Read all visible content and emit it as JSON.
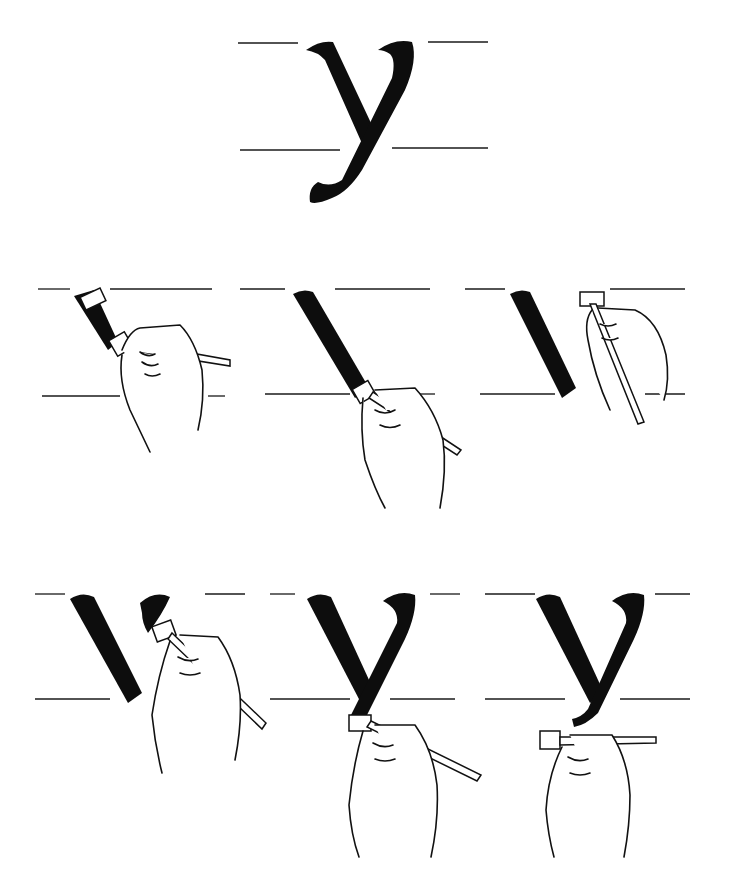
{
  "figure": {
    "letter": "y",
    "colors": {
      "ink": "#0d0d0d",
      "background": "#ffffff",
      "guide_lines": "#1a1a1a"
    },
    "main_glyph": {
      "label": "completed letter y"
    },
    "steps": [
      {
        "index": 1,
        "label": "pen placed at top of first diagonal stroke"
      },
      {
        "index": 2,
        "label": "first diagonal stroke pulled down to baseline"
      },
      {
        "index": 3,
        "label": "pen repositioned at top right for second stroke"
      },
      {
        "index": 4,
        "label": "second stroke begins with curved entry"
      },
      {
        "index": 5,
        "label": "second stroke pulled down through baseline"
      },
      {
        "index": 6,
        "label": "descender tail finished with horizontal pen"
      }
    ]
  }
}
